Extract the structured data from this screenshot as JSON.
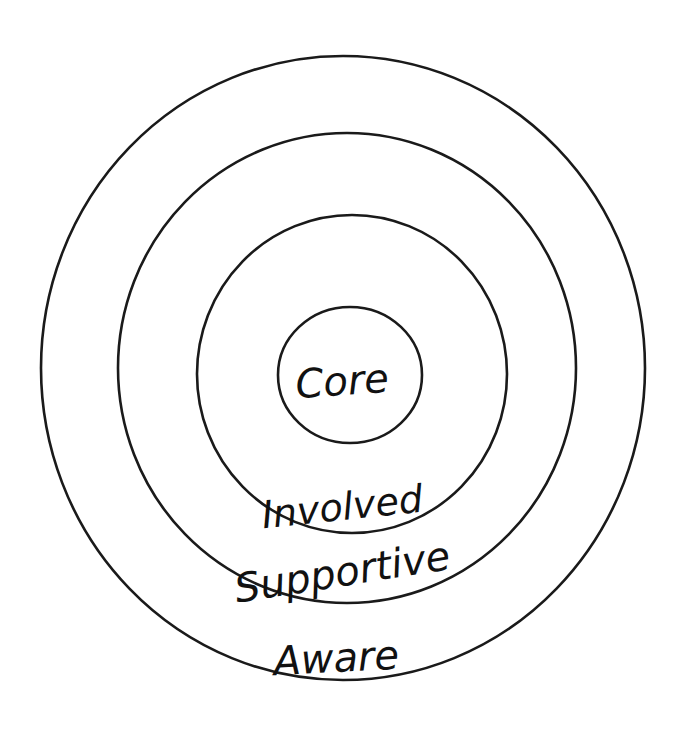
{
  "diagram": {
    "type": "concentric-circles",
    "background": "#ffffff",
    "stroke_color": "#1a1a1a",
    "rings": [
      {
        "label": "Aware",
        "cx": 343,
        "cy": 368,
        "rx": 302,
        "ry": 312
      },
      {
        "label": "Supportive",
        "cx": 347,
        "cy": 368,
        "rx": 229,
        "ry": 235
      },
      {
        "label": "Involved",
        "cx": 352,
        "cy": 374,
        "rx": 155,
        "ry": 159
      },
      {
        "label": "Core",
        "cx": 350,
        "cy": 375,
        "rx": 72,
        "ry": 68
      }
    ]
  }
}
